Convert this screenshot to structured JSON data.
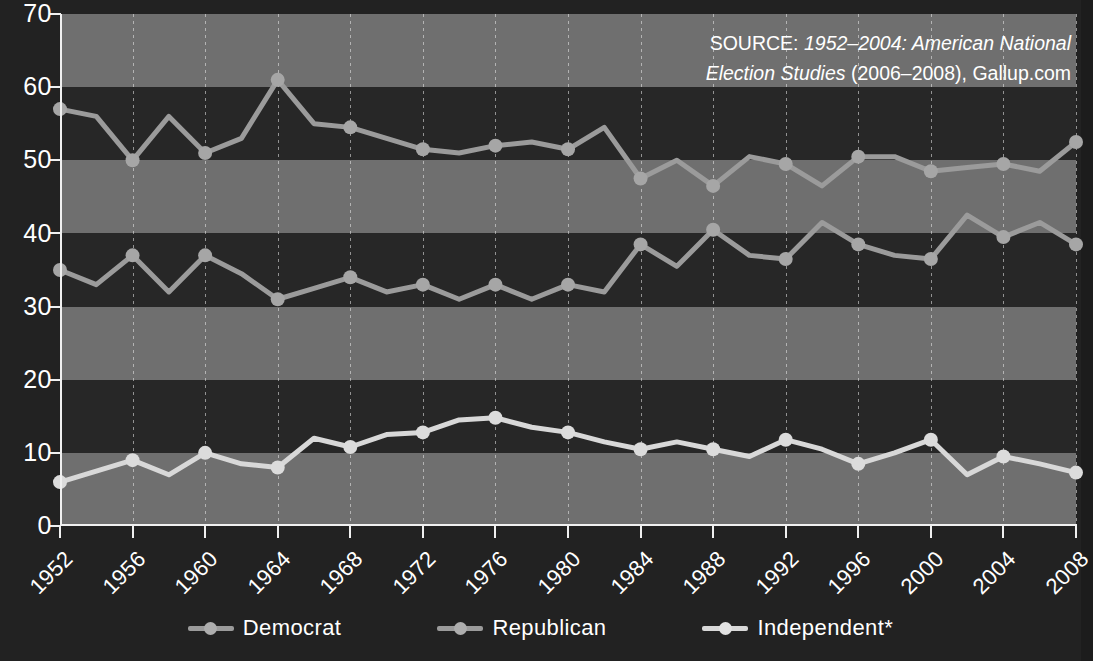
{
  "source_note": {
    "prefix": "SOURCE: ",
    "italic": "1952–2004: American National Election Studies",
    "suffix": " (2006–2008), Gallup.com",
    "full": "SOURCE: 1952–2004: American National Election Studies (2006–2008), Gallup.com"
  },
  "legend": {
    "position": "bottom-center",
    "items": [
      {
        "label": "Democrat",
        "color": "#9b9b9b"
      },
      {
        "label": "Republican",
        "color": "#9b9b9b"
      },
      {
        "label": "Independent*",
        "color": "#d8d8d8"
      }
    ]
  },
  "axes": {
    "y_ticks": [
      "0",
      "10",
      "20",
      "30",
      "40",
      "50",
      "60",
      "70"
    ],
    "x_ticks": [
      "1952",
      "1956",
      "1960",
      "1964",
      "1968",
      "1972",
      "1976",
      "1980",
      "1984",
      "1988",
      "1992",
      "1996",
      "2000",
      "2004",
      "2008"
    ]
  },
  "colors": {
    "background": "#222222",
    "band_light": "#6f6f6f",
    "band_dark": "#272727",
    "axis": "#f0f0f0",
    "gridline": "#ebebeb",
    "series_democrat": "#9b9b9b",
    "series_republican": "#9b9b9b",
    "series_independent": "#d8d8d8",
    "text": "#ffffff"
  },
  "chart_data": {
    "type": "line",
    "title": "",
    "subtitle": "",
    "xlabel": "",
    "ylabel": "",
    "xlim": [
      1952,
      2008
    ],
    "ylim": [
      0,
      70
    ],
    "y_tick_step": 10,
    "x_tick_step": 4,
    "x_data_step": 2,
    "grid": "vertical dotted at each labeled 4-year tick; alternating horizontal shaded bands every 10 units",
    "legend_position": "bottom-center",
    "x": [
      1952,
      1954,
      1956,
      1958,
      1960,
      1962,
      1964,
      1966,
      1968,
      1970,
      1972,
      1974,
      1976,
      1978,
      1980,
      1982,
      1984,
      1986,
      1988,
      1990,
      1992,
      1994,
      1996,
      1998,
      2000,
      2002,
      2004,
      2006,
      2008
    ],
    "series": [
      {
        "name": "Democrat",
        "color": "#9b9b9b",
        "values": [
          57.0,
          56.0,
          50.0,
          56.0,
          51.0,
          53.0,
          61.0,
          55.0,
          54.5,
          53.0,
          51.5,
          51.0,
          52.0,
          52.5,
          51.5,
          54.5,
          47.5,
          50.0,
          46.5,
          50.5,
          49.5,
          46.5,
          50.5,
          50.5,
          48.5,
          49.0,
          49.5,
          48.5,
          52.5
        ]
      },
      {
        "name": "Republican",
        "color": "#9b9b9b",
        "values": [
          35.0,
          33.0,
          37.0,
          32.0,
          37.0,
          34.5,
          31.0,
          32.5,
          34.0,
          32.0,
          33.0,
          31.0,
          33.0,
          31.0,
          33.0,
          32.0,
          38.5,
          35.5,
          40.5,
          37.0,
          36.5,
          41.5,
          38.5,
          37.0,
          36.5,
          42.5,
          39.5,
          41.5,
          38.5
        ]
      },
      {
        "name": "Independent*",
        "color": "#d8d8d8",
        "values": [
          6.0,
          7.5,
          9.0,
          7.0,
          10.0,
          8.5,
          8.0,
          12.0,
          10.8,
          12.5,
          12.8,
          14.5,
          14.8,
          13.5,
          12.8,
          11.5,
          10.5,
          11.5,
          10.5,
          9.5,
          11.8,
          10.5,
          8.5,
          10.0,
          11.8,
          7.0,
          9.5,
          8.5,
          7.3
        ]
      }
    ]
  }
}
